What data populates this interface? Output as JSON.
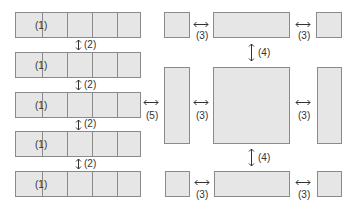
{
  "diagram": {
    "left_panel": {
      "strips": [
        {
          "label": "(1)"
        },
        {
          "label": "(1)"
        },
        {
          "label": "(1)"
        },
        {
          "label": "(1)"
        },
        {
          "label": "(1)"
        }
      ],
      "gap_labels": [
        "(2)",
        "(2)",
        "(2)",
        "(2)"
      ]
    },
    "between_panels_label": "(5)",
    "right_panel": {
      "horizontal_gap_labels": [
        "(3)",
        "(3)",
        "(3)",
        "(3)",
        "(3)",
        "(3)"
      ],
      "vertical_gap_labels": [
        "(4)",
        "(4)"
      ]
    },
    "colors": {
      "fill": "#e6e6e6",
      "stroke": "#8a8a8a",
      "text": "#333333"
    }
  }
}
